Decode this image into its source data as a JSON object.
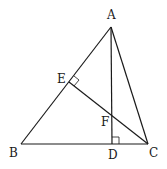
{
  "diagram": {
    "type": "geometry",
    "points": {
      "A": {
        "label": "A",
        "x": 111,
        "y": 27,
        "lx": 107,
        "ly": 19
      },
      "B": {
        "label": "B",
        "x": 21,
        "y": 144,
        "lx": 9,
        "ly": 157
      },
      "C": {
        "label": "C",
        "x": 148,
        "y": 144,
        "lx": 149,
        "ly": 157
      },
      "D": {
        "label": "D",
        "x": 112,
        "y": 144,
        "lx": 108,
        "ly": 159
      },
      "E": {
        "label": "E",
        "x": 69,
        "y": 82,
        "lx": 57,
        "ly": 83
      },
      "F": {
        "label": "F",
        "x": 112,
        "y": 115,
        "lx": 101,
        "ly": 126
      }
    },
    "segments": [
      "AB",
      "BC",
      "CA",
      "AD",
      "CE"
    ],
    "right_angles": [
      "E (CE ⊥ AB)",
      "D (AD ⊥ BC)"
    ],
    "stroke_color": "#1a1a1a",
    "background": "#ffffff"
  }
}
